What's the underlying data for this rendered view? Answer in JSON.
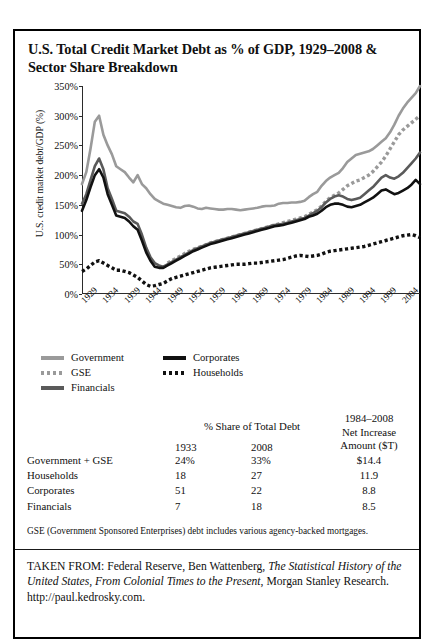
{
  "figure": {
    "title_line1": "U.S. Total Credit Market Debt as % of GDP, 1929–2008 &",
    "title_line2": "Sector Share Breakdown"
  },
  "chart_data": {
    "type": "line",
    "title": "U.S. Total Credit Market Debt as % of GDP, 1929–2008 & Sector Share Breakdown",
    "xlabel": "",
    "ylabel": "U.S. credit market debt/GDP (%)",
    "ylim": [
      0,
      350
    ],
    "ytick_labels": [
      "0%",
      "50%",
      "100%",
      "150%",
      "200%",
      "250%",
      "300%",
      "350%"
    ],
    "ytick_values": [
      0,
      50,
      100,
      150,
      200,
      250,
      300,
      350
    ],
    "xlim": [
      1929,
      2008
    ],
    "xtick_labels": [
      "1929",
      "1934",
      "1939",
      "1944",
      "1949",
      "1954",
      "1959",
      "1964",
      "1969",
      "1974",
      "1979",
      "1984",
      "1989",
      "1994",
      "1999",
      "2004"
    ],
    "xtick_values": [
      1929,
      1934,
      1939,
      1944,
      1949,
      1954,
      1959,
      1964,
      1969,
      1974,
      1979,
      1984,
      1989,
      1994,
      1999,
      2004
    ],
    "grid": false,
    "legend_position": "below",
    "x": [
      1929,
      1930,
      1931,
      1932,
      1933,
      1934,
      1935,
      1936,
      1937,
      1938,
      1939,
      1940,
      1941,
      1942,
      1943,
      1944,
      1945,
      1946,
      1947,
      1948,
      1949,
      1950,
      1951,
      1952,
      1953,
      1954,
      1955,
      1956,
      1957,
      1958,
      1959,
      1960,
      1961,
      1962,
      1963,
      1964,
      1965,
      1966,
      1967,
      1968,
      1969,
      1970,
      1971,
      1972,
      1973,
      1974,
      1975,
      1976,
      1977,
      1978,
      1979,
      1980,
      1981,
      1982,
      1983,
      1984,
      1985,
      1986,
      1987,
      1988,
      1989,
      1990,
      1991,
      1992,
      1993,
      1994,
      1995,
      1996,
      1997,
      1998,
      1999,
      2000,
      2001,
      2002,
      2003,
      2004,
      2005,
      2006,
      2007,
      2008
    ],
    "series": [
      {
        "name": "Government",
        "style": "solid",
        "color": "#9a9a9a",
        "values": [
          185,
          205,
          245,
          290,
          300,
          268,
          250,
          235,
          215,
          210,
          205,
          196,
          188,
          200,
          185,
          178,
          168,
          160,
          156,
          152,
          150,
          148,
          146,
          145,
          148,
          149,
          147,
          144,
          143,
          145,
          144,
          143,
          142,
          142,
          143,
          143,
          142,
          141,
          142,
          143,
          144,
          145,
          147,
          148,
          148,
          149,
          152,
          153,
          153,
          154,
          154,
          155,
          157,
          163,
          168,
          172,
          182,
          190,
          196,
          200,
          204,
          212,
          222,
          228,
          234,
          236,
          238,
          240,
          244,
          250,
          256,
          262,
          272,
          285,
          300,
          312,
          322,
          330,
          338,
          350
        ]
      },
      {
        "name": "GSE",
        "style": "dotted",
        "color": "#9a9a9a",
        "values": [
          null,
          null,
          null,
          null,
          null,
          null,
          null,
          null,
          null,
          null,
          null,
          null,
          null,
          null,
          null,
          null,
          null,
          null,
          null,
          null,
          52,
          56,
          60,
          64,
          68,
          72,
          75,
          78,
          80,
          83,
          86,
          88,
          90,
          92,
          94,
          96,
          98,
          100,
          102,
          104,
          106,
          108,
          110,
          112,
          114,
          116,
          118,
          120,
          122,
          124,
          126,
          128,
          130,
          134,
          138,
          142,
          148,
          156,
          162,
          166,
          170,
          176,
          182,
          186,
          190,
          192,
          196,
          200,
          206,
          214,
          222,
          232,
          244,
          256,
          268,
          276,
          282,
          288,
          294,
          300
        ]
      },
      {
        "name": "Financials",
        "style": "solid",
        "color": "#5a5a5a",
        "values": [
          152,
          168,
          192,
          215,
          228,
          210,
          178,
          160,
          140,
          138,
          136,
          130,
          122,
          118,
          100,
          78,
          62,
          52,
          48,
          46,
          50,
          54,
          58,
          62,
          66,
          70,
          74,
          77,
          80,
          83,
          86,
          88,
          90,
          92,
          94,
          96,
          98,
          100,
          102,
          104,
          106,
          108,
          110,
          112,
          114,
          116,
          117,
          118,
          120,
          122,
          124,
          126,
          128,
          132,
          136,
          140,
          146,
          154,
          160,
          164,
          166,
          164,
          160,
          158,
          160,
          162,
          168,
          174,
          180,
          188,
          196,
          200,
          196,
          194,
          198,
          204,
          212,
          220,
          228,
          238
        ]
      },
      {
        "name": "Corporates",
        "style": "solid",
        "color": "#111111",
        "values": [
          140,
          158,
          180,
          200,
          210,
          196,
          168,
          150,
          132,
          130,
          128,
          122,
          114,
          108,
          90,
          70,
          56,
          46,
          44,
          44,
          48,
          52,
          56,
          60,
          64,
          68,
          72,
          75,
          78,
          81,
          84,
          86,
          88,
          90,
          92,
          94,
          96,
          98,
          100,
          102,
          104,
          106,
          108,
          110,
          112,
          114,
          115,
          116,
          118,
          120,
          122,
          124,
          126,
          130,
          132,
          135,
          140,
          146,
          150,
          152,
          152,
          150,
          147,
          146,
          148,
          150,
          154,
          158,
          162,
          168,
          174,
          176,
          172,
          168,
          170,
          174,
          178,
          184,
          192,
          185
        ]
      },
      {
        "name": "Households",
        "style": "dotted",
        "color": "#111111",
        "values": [
          38,
          42,
          48,
          54,
          56,
          52,
          48,
          44,
          40,
          40,
          38,
          36,
          32,
          28,
          22,
          16,
          13,
          14,
          16,
          18,
          22,
          26,
          28,
          30,
          32,
          34,
          36,
          38,
          40,
          42,
          44,
          45,
          46,
          47,
          48,
          49,
          50,
          50,
          50,
          51,
          52,
          52,
          53,
          54,
          55,
          56,
          57,
          58,
          60,
          62,
          64,
          65,
          64,
          63,
          64,
          65,
          67,
          70,
          72,
          73,
          74,
          75,
          76,
          77,
          78,
          79,
          80,
          82,
          84,
          86,
          88,
          90,
          92,
          94,
          96,
          98,
          99,
          100,
          98,
          95
        ]
      }
    ]
  },
  "legend": {
    "items": [
      {
        "label": "Government",
        "color": "#9a9a9a",
        "style": "solid",
        "column": 1
      },
      {
        "label": "Corporates",
        "color": "#111111",
        "style": "solid",
        "column": 2
      },
      {
        "label": "GSE",
        "color": "#9a9a9a",
        "style": "dotted",
        "column": 1
      },
      {
        "label": "Households",
        "color": "#111111",
        "style": "dotted",
        "column": 2
      },
      {
        "label": "Financials",
        "color": "#5a5a5a",
        "style": "solid",
        "column": 1
      }
    ]
  },
  "table": {
    "group_header": "% Share of Total Debt",
    "net_header_line1": "1984–2008",
    "net_header_line2": "Net Increase",
    "net_header_line3": "Amount ($T)",
    "year_headers": [
      "1933",
      "2008"
    ],
    "rows": [
      {
        "name": "Government + GSE",
        "share_1933": "24%",
        "share_2008": "33%",
        "net_increase": "$14.4"
      },
      {
        "name": "Households",
        "share_1933": "18",
        "share_2008": "27",
        "net_increase": "11.9"
      },
      {
        "name": "Corporates",
        "share_1933": "51",
        "share_2008": "22",
        "net_increase": "8.8"
      },
      {
        "name": "Financials",
        "share_1933": "7",
        "share_2008": "18",
        "net_increase": "8.5"
      }
    ]
  },
  "footnote": {
    "text": "GSE (Government Sponsored Enterprises) debt includes various agency-backed mortgages."
  },
  "source": {
    "prefix": "TAKEN FROM: Federal Reserve, Ben Wattenberg, ",
    "italic_title": "The Statistical History of the United States, From Colonial Times to the Present",
    "suffix": ", Morgan Stanley Research. http://paul.kedrosky.com."
  }
}
